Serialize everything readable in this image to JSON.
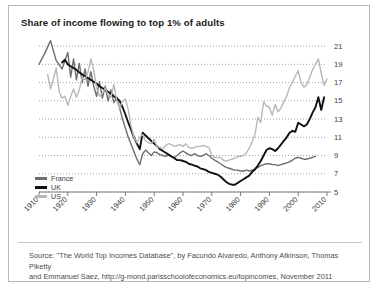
{
  "title": "Share of income flowing to top 1% of adults",
  "source_line1": "Source: \"The World Top Incomes Database\", by Facundo Alvaredo, Anthony Atkinson, Thomas Piketty",
  "source_line2": "and Emmanuel Saez, http://g-mond.parisschoolofeconomics.eu/topincomes, November 2011",
  "legend": {
    "items": [
      {
        "label": "France",
        "color": "#6e6e6e"
      },
      {
        "label": "UK",
        "color": "#111111"
      },
      {
        "label": "US",
        "color": "#b8b8b8"
      }
    ]
  },
  "chart_data": {
    "type": "line",
    "title": "Share of income flowing to top 1% of adults",
    "xlabel": "",
    "ylabel": "",
    "xlim": [
      1910,
      2010
    ],
    "ylim": [
      5,
      22
    ],
    "yticks": [
      5,
      7,
      9,
      11,
      13,
      15,
      17,
      19,
      21
    ],
    "xticks": [
      1910,
      1920,
      1930,
      1940,
      1950,
      1960,
      1970,
      1980,
      1990,
      2000,
      2010
    ],
    "grid": "horizontal-dotted",
    "y_axis_position": "right",
    "legend_position": "bottom-left",
    "series": [
      {
        "name": "France",
        "color": "#6e6e6e",
        "x": [
          1910,
          1912,
          1914,
          1916,
          1918,
          1920,
          1921,
          1922,
          1923,
          1924,
          1925,
          1926,
          1927,
          1928,
          1929,
          1930,
          1931,
          1932,
          1933,
          1934,
          1935,
          1936,
          1937,
          1938,
          1939,
          1940,
          1941,
          1942,
          1943,
          1944,
          1945,
          1946,
          1947,
          1948,
          1949,
          1950,
          1951,
          1952,
          1953,
          1954,
          1955,
          1956,
          1957,
          1958,
          1959,
          1960,
          1961,
          1962,
          1963,
          1964,
          1965,
          1966,
          1967,
          1968,
          1969,
          1970,
          1971,
          1972,
          1973,
          1974,
          1975,
          1976,
          1977,
          1978,
          1979,
          1980,
          1981,
          1982,
          1983,
          1984,
          1985,
          1986,
          1987,
          1988,
          1989,
          1990,
          1991,
          1992,
          1993,
          1994,
          1995,
          1996,
          1997,
          1998,
          1999,
          2000,
          2001,
          2002,
          2003,
          2004,
          2005,
          2006
        ],
        "values": [
          19.0,
          20.2,
          21.6,
          19.4,
          18.5,
          20.3,
          17.6,
          19.6,
          17.3,
          19.1,
          17.0,
          18.5,
          16.6,
          18.2,
          16.6,
          15.5,
          17.1,
          15.3,
          16.6,
          15.0,
          16.2,
          14.8,
          15.4,
          14.2,
          13.0,
          12.0,
          11.0,
          10.2,
          9.4,
          8.6,
          8.0,
          9.2,
          9.6,
          9.3,
          9.0,
          9.4,
          9.3,
          9.1,
          9.0,
          8.9,
          9.1,
          8.9,
          8.8,
          9.0,
          9.3,
          9.5,
          9.3,
          9.1,
          9.0,
          9.2,
          9.0,
          8.9,
          9.0,
          9.2,
          9.0,
          8.7,
          8.5,
          8.3,
          8.1,
          7.9,
          7.7,
          7.6,
          7.5,
          7.4,
          7.4,
          7.3,
          7.3,
          7.4,
          7.3,
          7.4,
          7.5,
          7.7,
          7.9,
          8.0,
          8.1,
          8.1,
          8.0,
          8.0,
          7.9,
          8.0,
          8.1,
          8.2,
          8.3,
          8.5,
          8.7,
          8.8,
          8.7,
          8.6,
          8.6,
          8.7,
          8.8,
          8.9
        ]
      },
      {
        "name": "UK",
        "color": "#111111",
        "x": [
          1918,
          1919,
          1920,
          1921,
          1922,
          1923,
          1924,
          1925,
          1926,
          1927,
          1928,
          1929,
          1930,
          1931,
          1932,
          1933,
          1934,
          1935,
          1936,
          1937,
          1938,
          1939,
          1940,
          1941,
          1942,
          1943,
          1944,
          1945,
          1946,
          1947,
          1948,
          1949,
          1950,
          1951,
          1952,
          1953,
          1954,
          1955,
          1956,
          1957,
          1958,
          1959,
          1960,
          1961,
          1962,
          1963,
          1964,
          1965,
          1966,
          1967,
          1968,
          1969,
          1970,
          1971,
          1972,
          1973,
          1974,
          1975,
          1976,
          1977,
          1978,
          1979,
          1980,
          1981,
          1982,
          1983,
          1984,
          1985,
          1986,
          1987,
          1988,
          1989,
          1990,
          1991,
          1992,
          1993,
          1994,
          1995,
          1996,
          1997,
          1998,
          1999,
          2000,
          2001,
          2002,
          2003,
          2004,
          2005,
          2006,
          2007,
          2008,
          2009
        ],
        "values": [
          19.2,
          19.5,
          19.0,
          18.8,
          18.6,
          18.4,
          18.1,
          17.9,
          17.7,
          17.5,
          17.3,
          17.1,
          16.9,
          16.6,
          16.4,
          16.2,
          16.0,
          15.8,
          15.5,
          15.3,
          15.0,
          14.3,
          13.5,
          12.6,
          11.8,
          11.0,
          10.3,
          9.7,
          11.5,
          11.2,
          10.9,
          10.6,
          10.3,
          10.0,
          9.7,
          9.5,
          9.3,
          9.1,
          8.9,
          8.7,
          8.5,
          8.5,
          8.4,
          8.3,
          8.1,
          8.0,
          7.9,
          7.8,
          7.6,
          7.5,
          7.4,
          7.2,
          7.1,
          7.0,
          6.9,
          6.7,
          6.4,
          6.1,
          5.9,
          5.8,
          5.8,
          6.0,
          6.2,
          6.4,
          6.6,
          6.8,
          7.2,
          7.5,
          7.9,
          8.4,
          9.0,
          9.6,
          9.8,
          9.7,
          9.5,
          9.8,
          10.2,
          10.6,
          11.0,
          11.5,
          11.7,
          11.6,
          12.6,
          12.4,
          12.2,
          12.4,
          13.0,
          13.7,
          14.3,
          15.4,
          14.0,
          15.4
        ]
      },
      {
        "name": "US",
        "color": "#b8b8b8",
        "x": [
          1913,
          1914,
          1915,
          1916,
          1917,
          1918,
          1919,
          1920,
          1921,
          1922,
          1923,
          1924,
          1925,
          1926,
          1927,
          1928,
          1929,
          1930,
          1931,
          1932,
          1933,
          1934,
          1935,
          1936,
          1937,
          1938,
          1939,
          1940,
          1941,
          1942,
          1943,
          1944,
          1945,
          1946,
          1947,
          1948,
          1949,
          1950,
          1951,
          1952,
          1953,
          1954,
          1955,
          1956,
          1957,
          1958,
          1959,
          1960,
          1961,
          1962,
          1963,
          1964,
          1965,
          1966,
          1967,
          1968,
          1969,
          1970,
          1971,
          1972,
          1973,
          1974,
          1975,
          1976,
          1977,
          1978,
          1979,
          1980,
          1981,
          1982,
          1983,
          1984,
          1985,
          1986,
          1987,
          1988,
          1989,
          1990,
          1991,
          1992,
          1993,
          1994,
          1995,
          1996,
          1997,
          1998,
          1999,
          2000,
          2001,
          2002,
          2003,
          2004,
          2005,
          2006,
          2007,
          2008,
          2009,
          2010
        ],
        "values": [
          17.9,
          16.3,
          17.4,
          18.6,
          16.0,
          15.3,
          15.5,
          14.5,
          15.5,
          16.3,
          15.4,
          16.2,
          17.6,
          17.3,
          18.1,
          19.6,
          18.4,
          16.4,
          15.5,
          15.8,
          16.4,
          15.7,
          15.4,
          16.8,
          15.0,
          14.2,
          15.0,
          15.2,
          14.0,
          12.2,
          11.0,
          10.4,
          11.0,
          11.3,
          10.6,
          10.4,
          10.3,
          10.8,
          9.9,
          9.9,
          9.7,
          10.1,
          10.3,
          10.2,
          10.0,
          10.1,
          10.2,
          10.0,
          10.3,
          9.9,
          9.8,
          9.9,
          10.0,
          10.0,
          10.1,
          10.0,
          9.9,
          9.0,
          8.8,
          8.8,
          8.8,
          8.5,
          8.4,
          8.5,
          8.6,
          8.7,
          8.9,
          8.9,
          9.0,
          9.3,
          9.8,
          10.5,
          11.3,
          13.2,
          12.6,
          14.9,
          14.4,
          14.3,
          13.4,
          14.6,
          13.8,
          14.2,
          14.9,
          15.5,
          16.5,
          17.0,
          17.7,
          18.3,
          17.0,
          16.5,
          16.8,
          17.6,
          18.4,
          19.0,
          19.6,
          18.0,
          16.7,
          17.4
        ]
      }
    ]
  }
}
